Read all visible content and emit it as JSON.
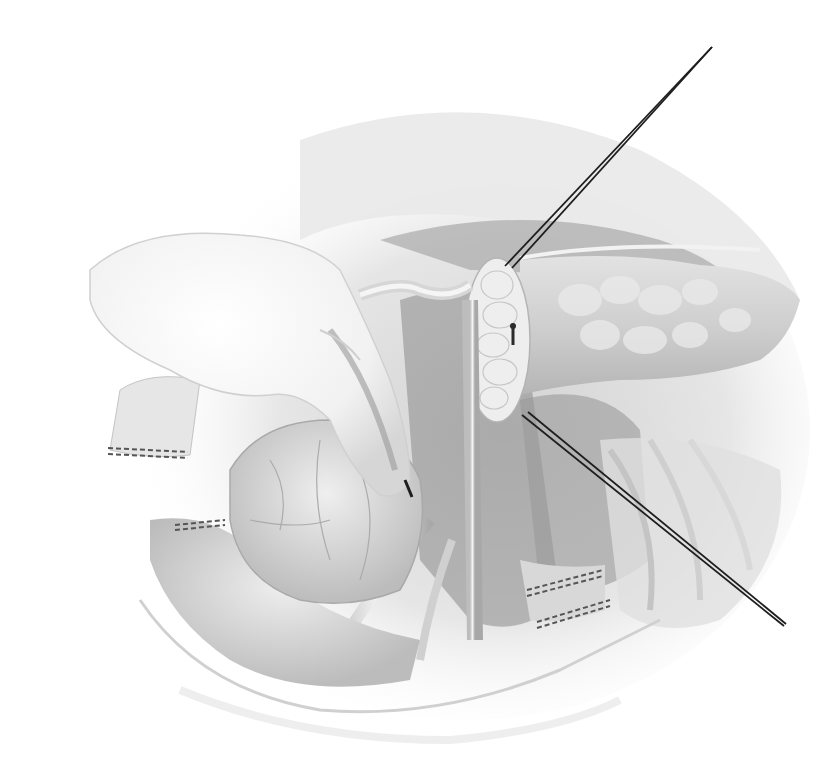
{
  "figure": {
    "type": "surgical-anatomy-illustration",
    "style": "grayscale pencil rendering",
    "text_labels": []
  },
  "palette": {
    "background": "#ffffff",
    "tissue_light": "#ececec",
    "tissue_mid": "#c8c8c8",
    "tissue_dark": "#8f8f8f",
    "shadow": "#6e6e6e",
    "instrument": "#1e1e1e",
    "staple_line": "#555555"
  },
  "elements": {
    "hand": "gloved-hand",
    "retractor_wires": 2,
    "pancreas_cut_surface": "transected-pancreatic-neck",
    "staple_lines": 4
  }
}
